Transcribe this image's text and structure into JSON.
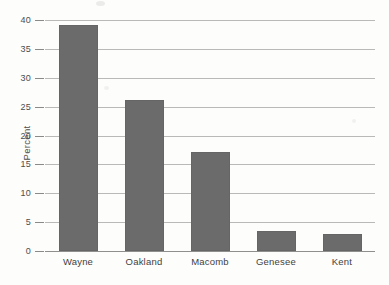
{
  "chart_data": {
    "type": "bar",
    "title": "",
    "subtitle": "",
    "xlabel": "",
    "ylabel": "Percent",
    "categories": [
      "Wayne",
      "Oakland",
      "Macomb",
      "Genesee",
      "Kent"
    ],
    "values": [
      39.2,
      26.1,
      17.2,
      3.4,
      2.9
    ],
    "series": [
      {
        "name": "Percent",
        "values": [
          39.2,
          26.1,
          17.2,
          3.4,
          2.9
        ]
      }
    ],
    "ylim": [
      0,
      40
    ],
    "ytick_step": 5,
    "ytick_labels": [
      "0",
      "5",
      "10",
      "15",
      "20",
      "25",
      "30",
      "35",
      "40"
    ],
    "ytick_values": [
      0,
      5,
      10,
      15,
      20,
      25,
      30,
      35,
      40
    ],
    "grid": true,
    "grid_axis": "y",
    "legend": false,
    "legend_position": "none",
    "bar_color": "#6b6b6b",
    "gridline_color": "#b9b9b7",
    "axis_color": "#8f8f8d",
    "background_color": "#fdfdfc",
    "annotations": []
  }
}
